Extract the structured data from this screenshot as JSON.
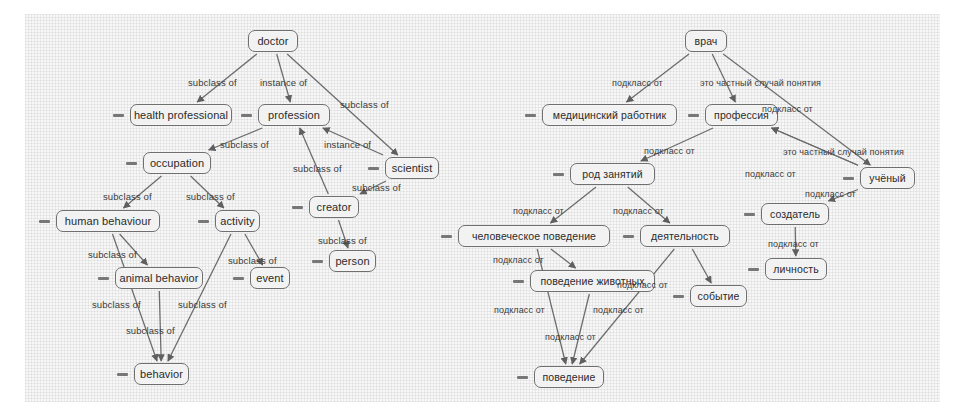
{
  "figure": {
    "panels": [
      {
        "id": "english",
        "language": "en",
        "relation_labels": {
          "subclass": "subclass of",
          "instance": "instance of"
        },
        "nodes": [
          {
            "id": "doctor",
            "label": "doctor",
            "x": 248,
            "y": 30,
            "w": 50,
            "dash": false
          },
          {
            "id": "health_professional",
            "label": "health professional",
            "x": 130,
            "y": 104,
            "w": 102,
            "dash": true
          },
          {
            "id": "profession",
            "label": "profession",
            "x": 258,
            "y": 104,
            "w": 72,
            "dash": true
          },
          {
            "id": "occupation",
            "label": "occupation",
            "x": 143,
            "y": 152,
            "w": 68,
            "dash": true
          },
          {
            "id": "scientist",
            "label": "scientist",
            "x": 385,
            "y": 157,
            "w": 54,
            "dash": true
          },
          {
            "id": "creator",
            "label": "creator",
            "x": 309,
            "y": 196,
            "w": 50,
            "dash": true
          },
          {
            "id": "human_behaviour",
            "label": "human behaviour",
            "x": 56,
            "y": 210,
            "w": 104,
            "dash": true
          },
          {
            "id": "activity",
            "label": "activity",
            "x": 215,
            "y": 210,
            "w": 45,
            "dash": true
          },
          {
            "id": "person",
            "label": "person",
            "x": 329,
            "y": 250,
            "w": 47,
            "dash": true
          },
          {
            "id": "animal_behavior",
            "label": "animal behavior",
            "x": 115,
            "y": 267,
            "w": 88,
            "dash": true
          },
          {
            "id": "event",
            "label": "event",
            "x": 250,
            "y": 267,
            "w": 40,
            "dash": true
          },
          {
            "id": "behavior",
            "label": "behavior",
            "x": 134,
            "y": 363,
            "w": 55,
            "dash": true
          }
        ],
        "edges": [
          {
            "from": "doctor",
            "to": "health_professional",
            "label": "subclass of",
            "label_x": 188,
            "label_y": 78
          },
          {
            "from": "doctor",
            "to": "profession",
            "label": "instance of",
            "label_x": 260,
            "label_y": 78
          },
          {
            "from": "doctor",
            "to": "scientist",
            "label": "subclass of",
            "label_x": 340,
            "label_y": 100
          },
          {
            "from": "profession",
            "to": "occupation",
            "label": "subclass of",
            "label_x": 220,
            "label_y": 140
          },
          {
            "from": "scientist",
            "to": "profession",
            "label": "instance of",
            "label_x": 324,
            "label_y": 140
          },
          {
            "from": "creator",
            "to": "profession",
            "label": "subclass of",
            "label_x": 293,
            "label_y": 164
          },
          {
            "from": "scientist",
            "to": "creator",
            "label": "subclass of",
            "label_x": 352,
            "label_y": 183
          },
          {
            "from": "occupation",
            "to": "human_behaviour",
            "label": "subclass of",
            "label_x": 103,
            "label_y": 192
          },
          {
            "from": "occupation",
            "to": "activity",
            "label": "subclass of",
            "label_x": 186,
            "label_y": 192
          },
          {
            "from": "creator",
            "to": "person",
            "label": "subclass of",
            "label_x": 318,
            "label_y": 236
          },
          {
            "from": "activity",
            "to": "event",
            "label": "subclass of",
            "label_x": 228,
            "label_y": 256
          },
          {
            "from": "human_behaviour",
            "to": "animal_behavior",
            "label": "subclass of",
            "label_x": 88,
            "label_y": 250
          },
          {
            "from": "human_behaviour",
            "to": "behavior",
            "label": "subclass of",
            "label_x": 92,
            "label_y": 300
          },
          {
            "from": "animal_behavior",
            "to": "behavior",
            "label": "subclass of",
            "label_x": 178,
            "label_y": 300
          },
          {
            "from": "activity",
            "to": "behavior",
            "label": "subclass of",
            "label_x": 126,
            "label_y": 326
          }
        ]
      },
      {
        "id": "russian",
        "language": "ru",
        "relation_labels": {
          "subclass": "подкласс от",
          "instance": "это частный случай понятия"
        },
        "nodes": [
          {
            "id": "vrach",
            "label": "врач",
            "x": 685,
            "y": 30,
            "w": 42,
            "dash": false
          },
          {
            "id": "medrabotnik",
            "label": "медицинский работник",
            "x": 542,
            "y": 104,
            "w": 135,
            "dash": true
          },
          {
            "id": "professiya",
            "label": "профессия",
            "x": 705,
            "y": 104,
            "w": 73,
            "dash": true
          },
          {
            "id": "rod_zanyatiy",
            "label": "род занятий",
            "x": 570,
            "y": 163,
            "w": 85,
            "dash": true
          },
          {
            "id": "uchenyy",
            "label": "учёный",
            "x": 860,
            "y": 167,
            "w": 55,
            "dash": true
          },
          {
            "id": "sozdatel",
            "label": "создатель",
            "x": 761,
            "y": 203,
            "w": 68,
            "dash": true
          },
          {
            "id": "chelovecheskoe_povedenie",
            "label": "человеческое поведение",
            "x": 458,
            "y": 225,
            "w": 152,
            "dash": true
          },
          {
            "id": "deyatelnost",
            "label": "деятельность",
            "x": 640,
            "y": 225,
            "w": 90,
            "dash": true
          },
          {
            "id": "lichnost",
            "label": "личность",
            "x": 765,
            "y": 258,
            "w": 62,
            "dash": true
          },
          {
            "id": "povedenie_zhivotnyh",
            "label": "поведение животных",
            "x": 530,
            "y": 270,
            "w": 125,
            "dash": true
          },
          {
            "id": "sobytie",
            "label": "событие",
            "x": 690,
            "y": 285,
            "w": 57,
            "dash": true
          },
          {
            "id": "povedenie",
            "label": "поведение",
            "x": 534,
            "y": 366,
            "w": 70,
            "dash": true
          }
        ],
        "edges": [
          {
            "from": "vrach",
            "to": "medrabotnik",
            "label": "подкласс от",
            "label_x": 612,
            "label_y": 79
          },
          {
            "from": "vrach",
            "to": "professiya",
            "label": "это частный случай понятия",
            "label_x": 700,
            "label_y": 79
          },
          {
            "from": "vrach",
            "to": "uchenyy",
            "label": "подкласс от",
            "label_x": 762,
            "label_y": 105
          },
          {
            "from": "professiya",
            "to": "rod_zanyatiy",
            "label": "подкласс от",
            "label_x": 644,
            "label_y": 147
          },
          {
            "from": "uchenyy",
            "to": "professiya",
            "label": "это частный случай понятия",
            "label_x": 783,
            "label_y": 148
          },
          {
            "from": "uchenyy",
            "to": "professiya",
            "label": "подкласс от",
            "label_x": 745,
            "label_y": 170
          },
          {
            "from": "uchenyy",
            "to": "sozdatel",
            "label": "подкласс от",
            "label_x": 805,
            "label_y": 190
          },
          {
            "from": "rod_zanyatiy",
            "to": "chelovecheskoe_povedenie",
            "label": "подкласс от",
            "label_x": 513,
            "label_y": 207
          },
          {
            "from": "rod_zanyatiy",
            "to": "deyatelnost",
            "label": "подкласс от",
            "label_x": 613,
            "label_y": 207
          },
          {
            "from": "sozdatel",
            "to": "lichnost",
            "label": "подкласс от",
            "label_x": 768,
            "label_y": 240
          },
          {
            "from": "chelovecheskoe_povedenie",
            "to": "povedenie_zhivotnyh",
            "label": "подкласс от",
            "label_x": 493,
            "label_y": 256
          },
          {
            "from": "deyatelnost",
            "to": "sobytie",
            "label": "подкласс от",
            "label_x": 617,
            "label_y": 281
          },
          {
            "from": "chelovecheskoe_povedenie",
            "to": "povedenie",
            "label": "подкласс от",
            "label_x": 494,
            "label_y": 306
          },
          {
            "from": "povedenie_zhivotnyh",
            "to": "povedenie",
            "label": "подкласс от",
            "label_x": 593,
            "label_y": 306
          },
          {
            "from": "deyatelnost",
            "to": "povedenie",
            "label": "подкласс от",
            "label_x": 545,
            "label_y": 333
          }
        ]
      }
    ]
  }
}
